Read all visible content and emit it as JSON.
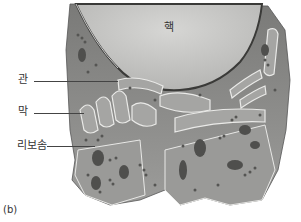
{
  "figure": {
    "panel_label": "(b)",
    "labels": {
      "nucleus": "핵",
      "tube": "관",
      "membrane": "막",
      "ribosome": "리보솜"
    },
    "colors": {
      "nucleus_fill": "#c9c9c7",
      "er_fill": "#8f8f8d",
      "er_dark": "#4a4a48",
      "er_edge": "#e8e8e6",
      "ribosome": "#5a5a58",
      "background": "#ffffff"
    }
  }
}
